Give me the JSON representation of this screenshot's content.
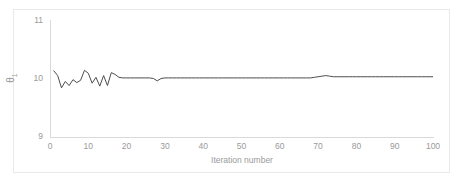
{
  "chart_data": {
    "type": "line",
    "title": "",
    "xlabel": "Iteration number",
    "ylabel": "θ₁",
    "ylabel_base": "θ",
    "ylabel_sub": "1",
    "xlim": [
      0,
      100
    ],
    "ylim": [
      9,
      11
    ],
    "xticks": [
      0,
      10,
      20,
      30,
      40,
      50,
      60,
      70,
      80,
      90,
      100
    ],
    "yticks": [
      9,
      10,
      11
    ],
    "xtick_labels": [
      "0",
      "10",
      "20",
      "30",
      "40",
      "50",
      "60",
      "70",
      "80",
      "90",
      "100"
    ],
    "ytick_labels": [
      "11",
      "10",
      "9"
    ],
    "grid": false,
    "legend": false,
    "legend_position": "none",
    "line_color": "#4d4d4d",
    "axis_color": "#d9d9d9",
    "tick_label_color": "#9a9a9a",
    "background_color": "#ffffff",
    "series": [
      {
        "name": "theta_1",
        "x": [
          1,
          2,
          3,
          4,
          5,
          6,
          7,
          8,
          9,
          10,
          11,
          12,
          13,
          14,
          15,
          16,
          17,
          18,
          19,
          20,
          21,
          22,
          23,
          24,
          25,
          26,
          27,
          28,
          29,
          30,
          31,
          32,
          33,
          34,
          35,
          36,
          37,
          38,
          39,
          40,
          41,
          42,
          43,
          44,
          45,
          46,
          47,
          48,
          49,
          50,
          51,
          52,
          53,
          54,
          55,
          56,
          57,
          58,
          59,
          60,
          61,
          62,
          63,
          64,
          65,
          66,
          67,
          68,
          69,
          70,
          71,
          72,
          73,
          74,
          75,
          76,
          77,
          78,
          79,
          80,
          81,
          82,
          83,
          84,
          85,
          86,
          87,
          88,
          89,
          90,
          91,
          92,
          93,
          94,
          95,
          96,
          97,
          98,
          99,
          100
        ],
        "values": [
          10.13,
          10.05,
          9.84,
          9.95,
          9.88,
          9.98,
          9.93,
          9.97,
          10.14,
          10.09,
          9.92,
          10.02,
          9.87,
          10.05,
          9.88,
          10.1,
          10.07,
          10.02,
          10.01,
          10.01,
          10.01,
          10.01,
          10.01,
          10.01,
          10.01,
          10.01,
          10.0,
          9.96,
          10.0,
          10.01,
          10.01,
          10.01,
          10.01,
          10.01,
          10.01,
          10.01,
          10.01,
          10.01,
          10.01,
          10.01,
          10.01,
          10.01,
          10.01,
          10.01,
          10.01,
          10.01,
          10.01,
          10.01,
          10.01,
          10.01,
          10.01,
          10.01,
          10.01,
          10.01,
          10.01,
          10.01,
          10.01,
          10.01,
          10.01,
          10.01,
          10.01,
          10.01,
          10.01,
          10.01,
          10.01,
          10.01,
          10.01,
          10.01,
          10.02,
          10.03,
          10.04,
          10.05,
          10.04,
          10.03,
          10.03,
          10.03,
          10.03,
          10.03,
          10.03,
          10.03,
          10.03,
          10.03,
          10.03,
          10.03,
          10.03,
          10.03,
          10.03,
          10.03,
          10.03,
          10.03,
          10.03,
          10.03,
          10.03,
          10.03,
          10.03,
          10.03,
          10.03,
          10.03,
          10.03,
          10.03
        ]
      }
    ]
  }
}
